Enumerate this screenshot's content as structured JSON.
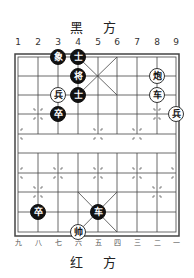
{
  "header": {
    "title": "黑 方"
  },
  "footer": {
    "title": "红 方"
  },
  "files_top": [
    "1",
    "2",
    "3",
    "4",
    "5",
    "6",
    "7",
    "8",
    "9"
  ],
  "files_bottom": [
    "九",
    "八",
    "七",
    "六",
    "五",
    "四",
    "三",
    "二",
    "一"
  ],
  "board": {
    "cols": 9,
    "rows": 10,
    "line_color": "#444444"
  },
  "pieces": [
    {
      "side": "black",
      "label": "象",
      "col": 3,
      "row": 0
    },
    {
      "side": "black",
      "label": "士",
      "col": 4,
      "row": 0
    },
    {
      "side": "black",
      "label": "将",
      "col": 4,
      "row": 1
    },
    {
      "side": "red",
      "label": "炮",
      "col": 8,
      "row": 1
    },
    {
      "side": "red",
      "label": "兵",
      "col": 3,
      "row": 2
    },
    {
      "side": "black",
      "label": "士",
      "col": 4,
      "row": 2
    },
    {
      "side": "red",
      "label": "车",
      "col": 8,
      "row": 2
    },
    {
      "side": "black",
      "label": "卒",
      "col": 3,
      "row": 3
    },
    {
      "side": "red",
      "label": "兵",
      "col": 9,
      "row": 3
    },
    {
      "side": "black",
      "label": "卒",
      "col": 2,
      "row": 8
    },
    {
      "side": "black",
      "label": "车",
      "col": 5,
      "row": 8
    },
    {
      "side": "red",
      "label": "帅",
      "col": 4,
      "row": 9
    }
  ]
}
